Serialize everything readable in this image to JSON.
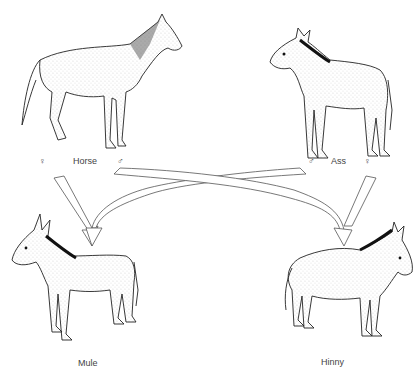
{
  "diagram": {
    "parents": [
      {
        "id": "horse",
        "label": "Horse",
        "female_symbol": "♀",
        "male_symbol": "♂"
      },
      {
        "id": "ass",
        "label": "Ass",
        "male_symbol": "♂",
        "female_symbol": "♀"
      }
    ],
    "offspring": [
      {
        "id": "mule",
        "label": "Mule"
      },
      {
        "id": "hinny",
        "label": "Hinny"
      }
    ],
    "crosses": [
      {
        "from": "Horse ♀",
        "to": "Mule"
      },
      {
        "from": "Ass ♂",
        "to": "Mule"
      },
      {
        "from": "Horse ♂",
        "to": "Hinny"
      },
      {
        "from": "Ass ♀",
        "to": "Hinny"
      }
    ]
  }
}
